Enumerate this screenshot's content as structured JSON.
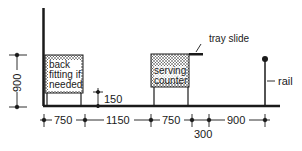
{
  "diagram": {
    "labels": {
      "back_fitting_line1": "back",
      "back_fitting_line2": "fitting if",
      "back_fitting_line3": "needed",
      "serving_line1": "serving",
      "serving_line2": "counter",
      "tray_slide": "tray slide",
      "rail": "rail"
    },
    "dimensions": {
      "height_900": "900",
      "gap_150": "150",
      "d1": "750",
      "d2": "1150",
      "d3": "750",
      "d4": "300",
      "d5": "900"
    },
    "colors": {
      "ink": "#1a1a1a",
      "background": "#ffffff"
    }
  }
}
